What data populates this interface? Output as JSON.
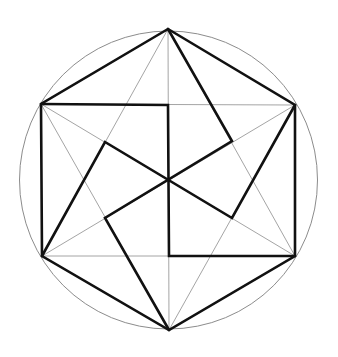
{
  "diagram": {
    "title": "",
    "colors": {
      "background": "#ffffff",
      "thick_line": "#111111",
      "thin_line": "#9a9a9a",
      "circle": "#8c8c8c"
    },
    "circle": {
      "cx": 168.5,
      "cy": 180,
      "r": 149
    },
    "points": {
      "T": [
        168,
        29
      ],
      "UR": [
        295,
        105
      ],
      "LR": [
        295,
        256
      ],
      "B": [
        169,
        330
      ],
      "LL": [
        42,
        256
      ],
      "UL": [
        41,
        104
      ],
      "C": [
        168,
        180
      ],
      "MT": [
        168,
        105
      ],
      "MB": [
        169,
        256
      ],
      "IUL": [
        105,
        142
      ],
      "IUR": [
        232,
        141
      ],
      "ILR": [
        232,
        218
      ],
      "ILL": [
        105,
        218
      ]
    },
    "thin_lines": [
      [
        "T",
        "LL"
      ],
      [
        "LL",
        "LR"
      ],
      [
        "LR",
        "T"
      ],
      [
        "B",
        "UL"
      ],
      [
        "UL",
        "UR"
      ],
      [
        "UR",
        "B"
      ],
      [
        "T",
        "B"
      ],
      [
        "UL",
        "LR"
      ],
      [
        "UR",
        "LL"
      ]
    ],
    "thick_polylines": [
      [
        "T",
        "UR",
        "LR",
        "B",
        "LL",
        "UL",
        "T"
      ],
      [
        "UL",
        "MT",
        "MB",
        "LR"
      ],
      [
        "T",
        "IUR",
        "ILL",
        "B"
      ],
      [
        "LL",
        "IUL",
        "ILR",
        "UR"
      ]
    ]
  }
}
